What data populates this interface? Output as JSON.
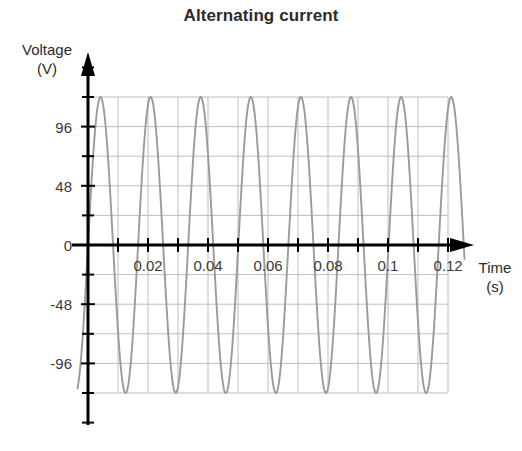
{
  "chart_data": {
    "type": "line",
    "title": "Alternating current",
    "xlabel": "Time",
    "xunit": "(s)",
    "ylabel": "Voltage",
    "yunit": "(V)",
    "xlim": [
      -0.004,
      0.1275
    ],
    "ylim": [
      -144,
      144
    ],
    "grid": true,
    "legend": "none",
    "x_ticks_major": [
      0.02,
      0.04,
      0.06,
      0.08,
      0.1,
      0.12
    ],
    "x_tick_labels": [
      "0.02",
      "0.04",
      "0.06",
      "0.08",
      "0.1",
      "0.12"
    ],
    "x_ticks_minor": [
      0.01,
      0.03,
      0.05,
      0.07,
      0.09,
      0.11
    ],
    "y_ticks_major": [
      96,
      48,
      0,
      -48,
      -96
    ],
    "y_tick_labels": [
      "96",
      "48",
      "0",
      "-48",
      "-96"
    ],
    "y_ticks_minor": [
      120,
      72,
      24,
      -24,
      -72,
      -120
    ],
    "grid_x_step": 0.01,
    "grid_y_step": 24,
    "series": [
      {
        "name": "Mains voltage",
        "color": "#9a9a9a",
        "waveform": "sine",
        "amplitude": 120,
        "period": 0.0167,
        "frequency_hz": 60,
        "phase_deg": 0,
        "x_start": -0.0035,
        "x_end": 0.1255,
        "values_note": "v(t) = 120 sin(2*pi*60*t)"
      }
    ]
  },
  "axes": {
    "y_arrow": "up-arrow-icon",
    "x_arrow": "right-arrow-icon"
  },
  "colors": {
    "curve": "#9a9a9a",
    "axis": "#000000",
    "grid": "#bdbdbd",
    "text": "#2b2b2b"
  }
}
